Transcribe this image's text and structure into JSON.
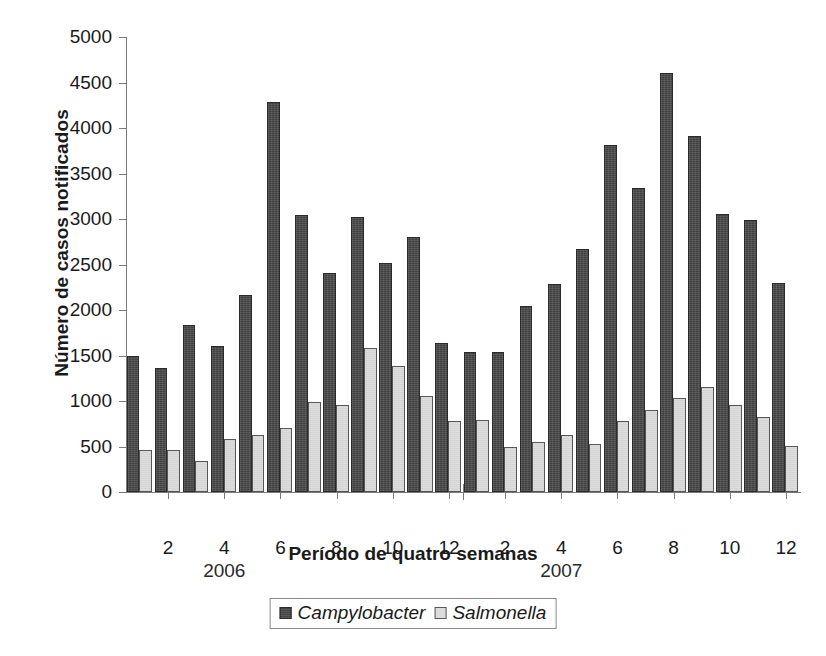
{
  "chart_data": {
    "type": "bar",
    "title": "",
    "xlabel": "Período de quatro semanas",
    "ylabel": "Número de casos notificados",
    "ylim": [
      0,
      5000
    ],
    "ytick_step": 500,
    "yticks": [
      "5000",
      "4500",
      "4000",
      "3500",
      "3000",
      "2500",
      "2000",
      "1500",
      "1000",
      "500",
      "0"
    ],
    "grid": false,
    "legend_position": "bottom-center",
    "categories": [
      "1",
      "2",
      "3",
      "4",
      "5",
      "6",
      "7",
      "8",
      "9",
      "10",
      "11",
      "12",
      "1",
      "2",
      "3",
      "4",
      "5",
      "6",
      "7",
      "8",
      "9",
      "10",
      "11",
      "12"
    ],
    "visible_xtick_labels": [
      "2",
      "4",
      "6",
      "8",
      "10",
      "12",
      "2",
      "4",
      "6",
      "8",
      "10",
      "12"
    ],
    "year_groups": [
      "2006",
      "2007"
    ],
    "series": [
      {
        "name": "Campylobacter",
        "color": "#4a4a4a",
        "values": [
          1500,
          1360,
          1840,
          1610,
          2170,
          4290,
          3040,
          2410,
          3020,
          2520,
          2800,
          1640,
          1540,
          1540,
          2040,
          2290,
          2670,
          3810,
          3340,
          4610,
          3910,
          3050,
          2990,
          2300
        ]
      },
      {
        "name": "Salmonella",
        "color": "#dcdcdc",
        "values": [
          460,
          460,
          340,
          580,
          630,
          700,
          990,
          960,
          1580,
          1380,
          1050,
          780,
          790,
          490,
          550,
          630,
          530,
          780,
          900,
          1030,
          1150,
          960,
          820,
          510
        ]
      }
    ]
  }
}
